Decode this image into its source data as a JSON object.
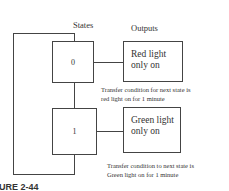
{
  "headers": {
    "states": "States",
    "outputs": "Outputs"
  },
  "states": [
    {
      "label": "0",
      "output": [
        "Red light",
        "only on"
      ],
      "condition": [
        "Transfer condition for next state is",
        "red light on for 1 minute"
      ]
    },
    {
      "label": "1",
      "output": [
        "Green light",
        "only on"
      ],
      "condition": [
        "Transfer condition to next state is",
        "Green light on for 1 minute"
      ]
    }
  ],
  "caption": "URE 2-44"
}
